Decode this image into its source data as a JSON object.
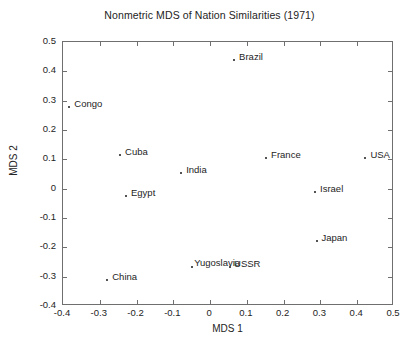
{
  "chart_data": {
    "type": "scatter",
    "title": "Nonmetric MDS of Nation Similarities (1971)",
    "xlabel": "MDS 1",
    "ylabel": "MDS 2",
    "xlim": [
      -0.4,
      0.5
    ],
    "ylim": [
      -0.4,
      0.5
    ],
    "xticks": [
      "-0.4",
      "-0.3",
      "-0.2",
      "-0.1",
      "0",
      "0.1",
      "0.2",
      "0.3",
      "0.4",
      "0.5"
    ],
    "xtick_values": [
      -0.4,
      -0.3,
      -0.2,
      -0.1,
      0,
      0.1,
      0.2,
      0.3,
      0.4,
      0.5
    ],
    "yticks": [
      "0.5",
      "0.4",
      "0.3",
      "0.2",
      "0.1",
      "0",
      "-0.1",
      "-0.2",
      "-0.3",
      "-0.4"
    ],
    "ytick_values": [
      0.5,
      0.4,
      0.3,
      0.2,
      0.1,
      0,
      -0.1,
      -0.2,
      -0.3,
      -0.4
    ],
    "grid": false,
    "legend": "none",
    "marker_color": "#1a1a1a",
    "axis_color": "#6f6f6f",
    "points": [
      {
        "label": "Brazil",
        "x": 0.068,
        "y": 0.435,
        "label_dx": 5,
        "label_dy": -9
      },
      {
        "label": "Congo",
        "x": -0.38,
        "y": 0.275,
        "label_dx": 5,
        "label_dy": -9
      },
      {
        "label": "Cuba",
        "x": -0.242,
        "y": 0.113,
        "label_dx": 5,
        "label_dy": -9
      },
      {
        "label": "India",
        "x": -0.076,
        "y": 0.05,
        "label_dx": 5,
        "label_dy": -9
      },
      {
        "label": "France",
        "x": 0.155,
        "y": 0.1,
        "label_dx": 5,
        "label_dy": -9
      },
      {
        "label": "USA",
        "x": 0.425,
        "y": 0.1,
        "label_dx": 5,
        "label_dy": -9
      },
      {
        "label": "Israel",
        "x": 0.288,
        "y": -0.015,
        "label_dx": 5,
        "label_dy": -9
      },
      {
        "label": "Egypt",
        "x": -0.226,
        "y": -0.03,
        "label_dx": 5,
        "label_dy": -9
      },
      {
        "label": "Japan",
        "x": 0.292,
        "y": -0.183,
        "label_dx": 5,
        "label_dy": -9
      },
      {
        "label": "Yugoslavia",
        "x": -0.046,
        "y": -0.27,
        "label_dx": 2,
        "label_dy": -10
      },
      {
        "label": "USSR",
        "x": 0.057,
        "y": -0.272,
        "label_dx": 4,
        "label_dy": -9
      },
      {
        "label": "China",
        "x": -0.277,
        "y": -0.315,
        "label_dx": 5,
        "label_dy": -9
      }
    ]
  }
}
